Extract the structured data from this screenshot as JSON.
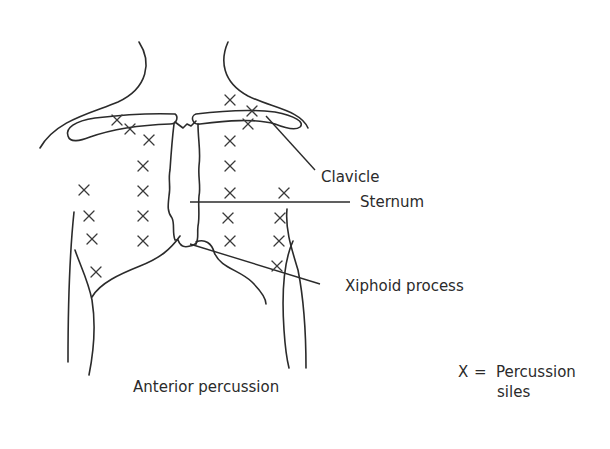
{
  "diagram": {
    "title": "Anterior percussion",
    "labels": {
      "clavicle": "Clavicle",
      "sternum": "Sternum",
      "xiphoid": "Xiphoid process"
    },
    "legend": {
      "symbol": "X",
      "equals": "=",
      "line1": "Percussion",
      "line2": "siles"
    },
    "colors": {
      "ink": "#2b2b2b",
      "background": "#ffffff"
    },
    "percussion_sites": [
      {
        "x": 117,
        "y": 120
      },
      {
        "x": 130,
        "y": 129
      },
      {
        "x": 149,
        "y": 140
      },
      {
        "x": 143,
        "y": 166
      },
      {
        "x": 143,
        "y": 191
      },
      {
        "x": 143,
        "y": 216
      },
      {
        "x": 143,
        "y": 241
      },
      {
        "x": 84,
        "y": 190
      },
      {
        "x": 89,
        "y": 216
      },
      {
        "x": 92,
        "y": 239
      },
      {
        "x": 96,
        "y": 272
      },
      {
        "x": 230,
        "y": 100
      },
      {
        "x": 252,
        "y": 111
      },
      {
        "x": 248,
        "y": 124
      },
      {
        "x": 230,
        "y": 141
      },
      {
        "x": 230,
        "y": 166
      },
      {
        "x": 230,
        "y": 193
      },
      {
        "x": 228,
        "y": 218
      },
      {
        "x": 230,
        "y": 241
      },
      {
        "x": 284,
        "y": 193
      },
      {
        "x": 280,
        "y": 218
      },
      {
        "x": 279,
        "y": 241
      },
      {
        "x": 277,
        "y": 266
      }
    ]
  }
}
